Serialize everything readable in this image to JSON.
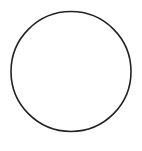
{
  "canvas": {
    "width": 142,
    "height": 151,
    "background": "#ffffff"
  },
  "shapes": [
    {
      "type": "circle",
      "cx": 71,
      "cy": 71.5,
      "r": 60,
      "stroke": "#222222",
      "stroke_width": 1.6,
      "fill": "none"
    }
  ]
}
